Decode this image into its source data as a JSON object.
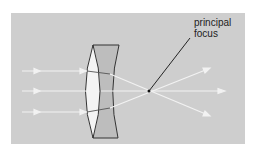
{
  "diagram": {
    "type": "optics-achromatic-doublet",
    "background_color": "#cfcfcf",
    "labels": {
      "principal_focus_line1": "principal",
      "principal_focus_line2": "focus"
    },
    "colors": {
      "panel": "#cecece",
      "convex_lens": "#f4f4f4",
      "concave_lens": "#bdbdbd",
      "outline": "#333333",
      "ray": "#f2f2f2",
      "leader_line": "#111111"
    },
    "rays": [
      {
        "name": "top",
        "y": 71
      },
      {
        "name": "middle",
        "y": 91
      },
      {
        "name": "bottom",
        "y": 112
      }
    ],
    "focus_point": {
      "x": 149,
      "y": 91
    }
  }
}
